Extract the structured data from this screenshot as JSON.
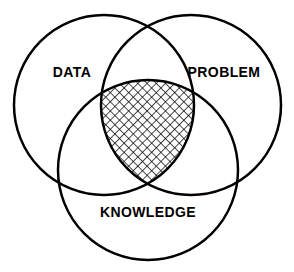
{
  "diagram": {
    "type": "venn-3-circle",
    "title": "",
    "background_color": "#ffffff",
    "stroke_color": "#000000",
    "stroke_width": 2.5,
    "fill_color": "none",
    "width": 294,
    "height": 272,
    "sets": [
      {
        "id": "data",
        "label": "DATA",
        "label_x": 72,
        "label_y": 73,
        "cx": 104,
        "cy": 105,
        "r": 90,
        "position": "top-left"
      },
      {
        "id": "problem",
        "label": "PROBLEM",
        "label_x": 224,
        "label_y": 73,
        "cx": 191,
        "cy": 105,
        "r": 90,
        "position": "top-right"
      },
      {
        "id": "knowledge",
        "label": "KNOWLEDGE",
        "label_x": 148,
        "label_y": 213,
        "cx": 148,
        "cy": 170,
        "r": 90,
        "position": "bottom-center"
      }
    ],
    "intersection": {
      "id": "triple-intersection",
      "label": "",
      "fill_pattern": "cross-hatch",
      "pattern_spacing": 6.5,
      "pattern_stroke_color": "#000000",
      "pattern_stroke_width": 1.4,
      "description": "center region shared by DATA, PROBLEM and KNOWLEDGE"
    }
  }
}
